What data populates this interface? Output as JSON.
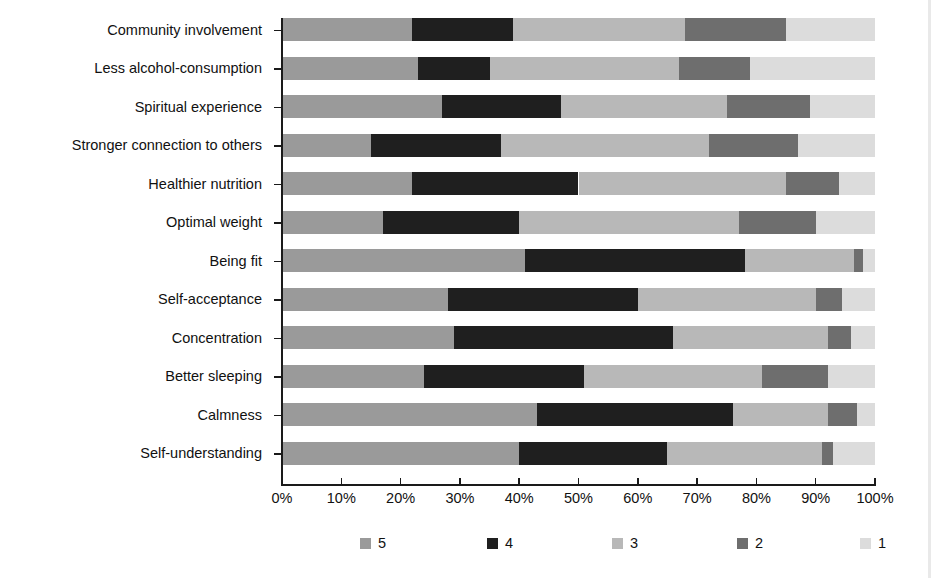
{
  "chart_data": {
    "type": "bar",
    "subtype": "stacked-horizontal-100pct",
    "title": "",
    "xlabel": "",
    "ylabel": "",
    "xlim": [
      0,
      100
    ],
    "xticks": [
      "0%",
      "10%",
      "20%",
      "30%",
      "40%",
      "50%",
      "60%",
      "70%",
      "80%",
      "90%",
      "100%"
    ],
    "xtick_values": [
      0,
      10,
      20,
      30,
      40,
      50,
      60,
      70,
      80,
      90,
      100
    ],
    "grid": false,
    "legend_position": "bottom",
    "categories": [
      "Community involvement",
      "Less alcohol-consumption",
      "Spiritual experience",
      "Stronger connection to others",
      "Healthier nutrition",
      "Optimal weight",
      "Being fit",
      "Self-acceptance",
      "Concentration",
      "Better sleeping",
      "Calmness",
      "Self-understanding"
    ],
    "series": [
      {
        "name": "5",
        "color": "#9a9a9a",
        "values": [
          22,
          23,
          27,
          15,
          22,
          17,
          41,
          28,
          29,
          24,
          43,
          40
        ]
      },
      {
        "name": "4",
        "color": "#1f1f1f",
        "values": [
          17,
          12,
          20,
          22,
          28,
          23,
          37,
          32,
          37,
          27,
          33,
          25
        ]
      },
      {
        "name": "3",
        "color": "#b8b8b8",
        "values": [
          29,
          32,
          28,
          35,
          35,
          37,
          18.5,
          30,
          26,
          30,
          16,
          26
        ]
      },
      {
        "name": "2",
        "color": "#6e6e6e",
        "values": [
          17,
          12,
          14,
          15,
          9,
          13,
          1.5,
          4.5,
          4,
          11,
          5,
          2
        ]
      },
      {
        "name": "1",
        "color": "#dcdcdc",
        "values": [
          15,
          21,
          11,
          13,
          6,
          10,
          2,
          5.5,
          4,
          8,
          3,
          7
        ]
      }
    ],
    "cumulative_boundaries": [
      [
        22,
        39,
        68,
        85,
        100
      ],
      [
        23,
        35,
        67,
        79,
        100
      ],
      [
        27,
        47,
        75,
        89,
        100
      ],
      [
        15,
        37,
        72,
        87,
        100
      ],
      [
        22,
        50,
        85,
        94,
        100
      ],
      [
        17,
        40,
        77,
        90,
        100
      ],
      [
        41,
        78,
        96.5,
        98,
        100
      ],
      [
        28,
        60,
        90,
        94.5,
        100
      ],
      [
        29,
        66,
        92,
        96,
        100
      ],
      [
        24,
        51,
        81,
        92,
        100
      ],
      [
        43,
        76,
        92,
        97,
        100
      ],
      [
        40,
        65,
        91,
        93,
        100
      ]
    ]
  },
  "legend": {
    "items": [
      {
        "label": "5",
        "color": "#9a9a9a"
      },
      {
        "label": "4",
        "color": "#1f1f1f"
      },
      {
        "label": "3",
        "color": "#b8b8b8"
      },
      {
        "label": "2",
        "color": "#6e6e6e"
      },
      {
        "label": "1",
        "color": "#dcdcdc"
      }
    ]
  },
  "colors": {
    "axis": "#1a1a1a",
    "text": "#111111",
    "background": "#ffffff"
  }
}
